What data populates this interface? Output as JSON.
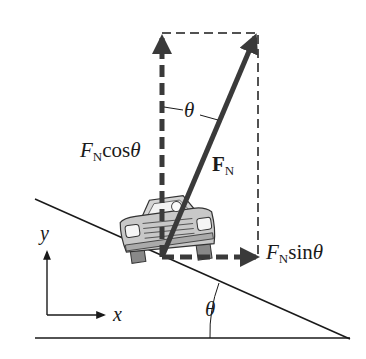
{
  "diagram": {
    "colors": {
      "line": "#1a1a1a",
      "vector": "#3a3a3a",
      "car_fill": "#c8c8c8",
      "car_stroke": "#333333"
    },
    "labels": {
      "fn_cos": {
        "symbol": "F",
        "subscript": "N",
        "func": "cos",
        "angle": "θ"
      },
      "fn_sin": {
        "symbol": "F",
        "subscript": "N",
        "func": "sin",
        "angle": "θ"
      },
      "fn_vec": {
        "symbol": "F",
        "subscript": "N"
      },
      "theta_top": "θ",
      "theta_bottom": "θ",
      "axis_x": "x",
      "axis_y": "y"
    }
  }
}
